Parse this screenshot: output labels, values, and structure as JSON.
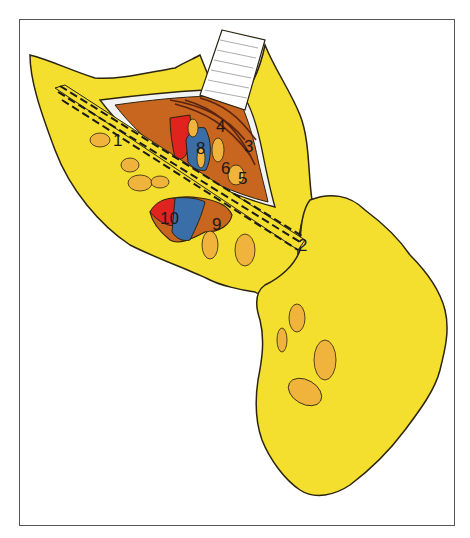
{
  "illustration": {
    "type": "surgical anatomical drawing",
    "colors": {
      "fat": "#f5df2e",
      "fat_outline": "#2a2410",
      "lymph_node": "#f0b43c",
      "muscle": "#c8651e",
      "muscle_dark": "#7a3414",
      "artery": "#e0231e",
      "vein": "#3a6ea8",
      "fascia": "#f2f2f2",
      "retractor": "#ffffff",
      "frame": "#555555"
    },
    "labels": [
      {
        "id": "1",
        "text": "1"
      },
      {
        "id": "2",
        "text": "2"
      },
      {
        "id": "3",
        "text": "3"
      },
      {
        "id": "4",
        "text": "4"
      },
      {
        "id": "5",
        "text": "5"
      },
      {
        "id": "6",
        "text": "6"
      },
      {
        "id": "8",
        "text": "8"
      },
      {
        "id": "9",
        "text": "9"
      },
      {
        "id": "10",
        "text": "10"
      }
    ]
  }
}
